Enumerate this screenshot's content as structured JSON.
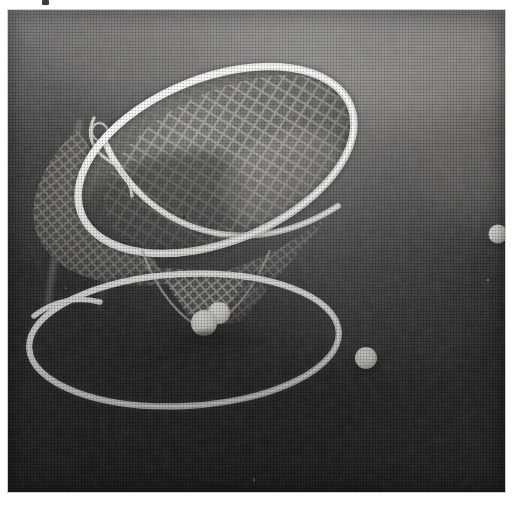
{
  "page": {
    "width": 520,
    "height": 505,
    "background_color": "#ffffff",
    "kind": "scanned-halftone-photograph",
    "alt_text": "Grainy black and white photograph of a conical golf chipping net on grass"
  },
  "photo": {
    "frame": {
      "x": 8,
      "y": 10,
      "width": 497,
      "height": 482
    },
    "tone": {
      "paper": "#ffffff",
      "grass_light": "#6e6e6e",
      "grass_mid": "#4a4a4a",
      "grass_dark": "#2a2a2a",
      "grass_shadow": "#1a1a1a",
      "highlight_white": "#f2f0ec",
      "net_mesh": "#c9c6bf",
      "ball_white": "#f4f2ee"
    },
    "scan_mark": {
      "x": 42,
      "y": 0,
      "width": 7,
      "height": 5,
      "color": "#2b2b2b"
    }
  },
  "subject": {
    "name": "golf chipping net",
    "parts": [
      {
        "id": "mouth-hoop",
        "label": "tilted elliptical rim hoop",
        "cx": 208,
        "cy": 150,
        "rx": 145,
        "ry": 82,
        "rotation": -22
      },
      {
        "id": "cone-mesh",
        "label": "conical diamond mesh netting",
        "apex_x": 200,
        "apex_y": 312
      },
      {
        "id": "ground-ring",
        "label": "ground ring resting on grass",
        "cx": 176,
        "cy": 330,
        "rx": 155,
        "ry": 65,
        "rotation": -3
      },
      {
        "id": "support-strut",
        "label": "faint support strut / leg",
        "from_x": 70,
        "from_y": 115,
        "to_x": 42,
        "to_y": 300
      }
    ]
  },
  "balls": [
    {
      "id": "ball-in-net-front",
      "label": "golf ball in net apex (front)",
      "cx": 196,
      "cy": 313,
      "r": 13
    },
    {
      "id": "ball-in-net-back",
      "label": "golf ball in net apex (back)",
      "cx": 211,
      "cy": 303,
      "r": 11
    },
    {
      "id": "ball-ground-right",
      "label": "golf ball on grass, right edge",
      "cx": 490,
      "cy": 224,
      "r": 9
    },
    {
      "id": "ball-ground-lower",
      "label": "golf ball on grass, lower centre-right",
      "cx": 358,
      "cy": 348,
      "r": 11
    }
  ],
  "specks": [
    {
      "cx": 176,
      "cy": 207,
      "r": 1.6
    },
    {
      "cx": 480,
      "cy": 270,
      "r": 1.2
    },
    {
      "cx": 246,
      "cy": 470,
      "r": 1.4
    },
    {
      "cx": 58,
      "cy": 278,
      "r": 1.1
    }
  ]
}
